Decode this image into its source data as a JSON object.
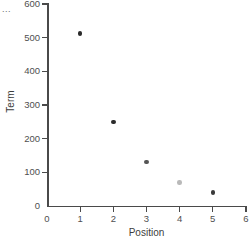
{
  "corner": {
    "ellipsis": "..."
  },
  "chart_data": {
    "type": "scatter",
    "title": "",
    "subtitle": "",
    "xlabel": "Position",
    "ylabel": "Term",
    "xlim": [
      0,
      6
    ],
    "ylim": [
      0,
      600
    ],
    "grid": false,
    "legend": false,
    "x_ticks": [
      "0",
      "1",
      "2",
      "3",
      "4",
      "5",
      "6"
    ],
    "y_ticks": [
      "0",
      "100",
      "200",
      "300",
      "400",
      "500",
      "600"
    ],
    "x": [
      1,
      2,
      3,
      4,
      5
    ],
    "y": [
      513,
      250,
      130,
      70,
      40
    ],
    "point_colors": [
      "#2b2b2b",
      "#2b2b2b",
      "#555555",
      "#b9b9b9",
      "#3a3a3a"
    ],
    "points": [
      {
        "x": 1,
        "y": 513,
        "color": "#2b2b2b"
      },
      {
        "x": 2,
        "y": 250,
        "color": "#2b2b2b"
      },
      {
        "x": 3,
        "y": 130,
        "color": "#555555"
      },
      {
        "x": 4,
        "y": 70,
        "color": "#b9b9b9"
      },
      {
        "x": 5,
        "y": 40,
        "color": "#3a3a3a"
      }
    ],
    "axis_color": "#4a4a4a",
    "tick_label_color": "#4f4f4f",
    "axis_title_color": "#3d3d3d",
    "background": "#ffffff"
  }
}
